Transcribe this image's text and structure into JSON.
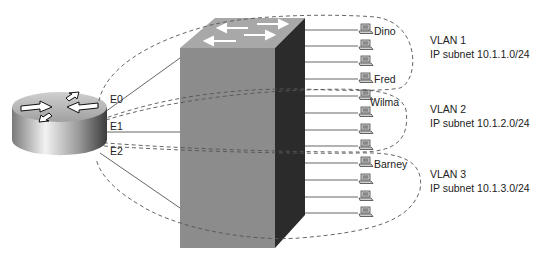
{
  "diagram": {
    "type": "router-on-a-stick VLAN topology",
    "router": {
      "icon": "router-icon",
      "interfaces": [
        {
          "name": "E0",
          "vlan": "VLAN 1"
        },
        {
          "name": "E1",
          "vlan": "VLAN 2"
        },
        {
          "name": "E2",
          "vlan": "VLAN 3"
        }
      ]
    },
    "switch": {
      "icon": "switch-icon"
    },
    "vlans": [
      {
        "name": "VLAN 1",
        "subnet": "IP subnet 10.1.1.0/24",
        "hosts": [
          "Dino",
          "",
          "",
          "Fred"
        ]
      },
      {
        "name": "VLAN 2",
        "subnet": "IP subnet 10.1.2.0/24",
        "hosts": [
          "Wilma",
          "",
          "",
          ""
        ]
      },
      {
        "name": "VLAN 3",
        "subnet": "IP subnet 10.1.3.0/24",
        "hosts": [
          "Barney",
          "",
          "",
          ""
        ]
      }
    ],
    "colors": {
      "switch_front": "#8c8c8c",
      "switch_side": "#2b2b2b",
      "switch_top": "#a8a8a8",
      "router_top": "#b5b5b5",
      "dashed_boundary": "#555555",
      "link": "#555555"
    }
  }
}
